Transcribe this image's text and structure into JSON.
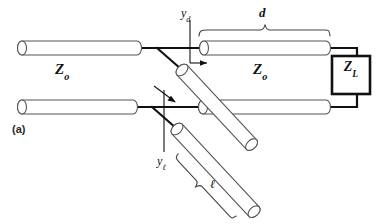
{
  "figure": {
    "panel_label": "(a)"
  },
  "labels": {
    "z_main": "Z",
    "z_main_sub": "o",
    "z_load": "Z",
    "z_load_sub": "L",
    "y_d": "y",
    "y_d_sub": "d",
    "y_l": "y",
    "y_l_sub": "ℓ",
    "length_d": "d",
    "length_l": "ℓ"
  },
  "colors": {
    "line": "#111111",
    "tube_outline": "#555555",
    "background": "#ffffff",
    "brace": "#444444"
  }
}
